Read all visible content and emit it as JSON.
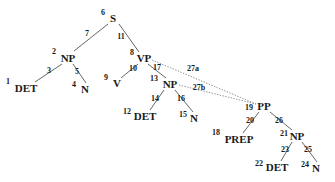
{
  "figure": {
    "name": "syntactic-parse-tree",
    "width": 335,
    "height": 182,
    "background": "#ffffff",
    "ink_color": "#1a1a1a",
    "solid_edge_color": "#555555",
    "dotted_edge_color": "#777777"
  },
  "nodes": [
    {
      "id": "n6",
      "label": "S",
      "index": "6",
      "x": 113,
      "y": 18,
      "index_x": 103,
      "index_y": 12
    },
    {
      "id": "n2",
      "label": "NP",
      "index": "2",
      "x": 68,
      "y": 58,
      "index_x": 54,
      "index_y": 51
    },
    {
      "id": "n8",
      "label": "VP",
      "index": "8",
      "x": 144,
      "y": 58,
      "index_x": 132,
      "index_y": 52
    },
    {
      "id": "n1",
      "label": "DET",
      "index": "1",
      "x": 26,
      "y": 88,
      "index_x": 8,
      "index_y": 81
    },
    {
      "id": "n4",
      "label": "N",
      "index": "4",
      "x": 85,
      "y": 89,
      "index_x": 74,
      "index_y": 84
    },
    {
      "id": "n9",
      "label": "V",
      "index": "9",
      "x": 117,
      "y": 83,
      "index_x": 106,
      "index_y": 77
    },
    {
      "id": "n13",
      "label": "NP",
      "index": "13",
      "x": 170,
      "y": 84,
      "index_x": 154,
      "index_y": 78
    },
    {
      "id": "n12",
      "label": "DET",
      "index": "12",
      "x": 145,
      "y": 116,
      "index_x": 127,
      "index_y": 111
    },
    {
      "id": "n15",
      "label": "N",
      "index": "15",
      "x": 194,
      "y": 118,
      "index_x": 183,
      "index_y": 114
    },
    {
      "id": "n19",
      "label": "PP",
      "index": "19",
      "x": 264,
      "y": 106,
      "index_x": 249,
      "index_y": 107
    },
    {
      "id": "n18",
      "label": "PREP",
      "index": "18",
      "x": 239,
      "y": 139,
      "index_x": 216,
      "index_y": 132
    },
    {
      "id": "n21",
      "label": "NP",
      "index": "21",
      "x": 297,
      "y": 136,
      "index_x": 284,
      "index_y": 133
    },
    {
      "id": "n22",
      "label": "DET",
      "index": "22",
      "x": 277,
      "y": 167,
      "index_x": 259,
      "index_y": 163
    },
    {
      "id": "n24",
      "label": "N",
      "index": "24",
      "x": 316,
      "y": 168,
      "index_x": 305,
      "index_y": 164
    }
  ],
  "edges": [
    {
      "id": "e7",
      "index": "7",
      "from": "n6",
      "to": "n2",
      "x1": 108,
      "y1": 24,
      "x2": 74,
      "y2": 51,
      "style": "solid",
      "index_x": 87,
      "index_y": 33
    },
    {
      "id": "e11",
      "index": "11",
      "from": "n6",
      "to": "n8",
      "x1": 119,
      "y1": 24,
      "x2": 139,
      "y2": 52,
      "style": "solid",
      "index_x": 121,
      "index_y": 36
    },
    {
      "id": "e3",
      "index": "3",
      "from": "n2",
      "to": "n1",
      "x1": 62,
      "y1": 64,
      "x2": 35,
      "y2": 82,
      "style": "solid",
      "index_x": 49,
      "index_y": 70
    },
    {
      "id": "e5",
      "index": "5",
      "from": "n2",
      "to": "n4",
      "x1": 73,
      "y1": 64,
      "x2": 86,
      "y2": 83,
      "style": "solid",
      "index_x": 77,
      "index_y": 71
    },
    {
      "id": "e10",
      "index": "10",
      "from": "n8",
      "to": "n9",
      "x1": 138,
      "y1": 64,
      "x2": 121,
      "y2": 78,
      "style": "solid",
      "index_x": 133,
      "index_y": 68
    },
    {
      "id": "e17",
      "index": "17",
      "from": "n8",
      "to": "n13",
      "x1": 148,
      "y1": 64,
      "x2": 166,
      "y2": 78,
      "style": "solid",
      "index_x": 157,
      "index_y": 67
    },
    {
      "id": "e14",
      "index": "14",
      "from": "n13",
      "to": "n12",
      "x1": 164,
      "y1": 90,
      "x2": 150,
      "y2": 110,
      "style": "solid",
      "index_x": 155,
      "index_y": 98
    },
    {
      "id": "e16",
      "index": "16",
      "from": "n13",
      "to": "n15",
      "x1": 175,
      "y1": 90,
      "x2": 193,
      "y2": 112,
      "style": "solid",
      "index_x": 181,
      "index_y": 98
    },
    {
      "id": "e27a",
      "index": "27a",
      "from": "n8",
      "to": "n19",
      "x1": 152,
      "y1": 60,
      "x2": 256,
      "y2": 104,
      "style": "dotted",
      "index_x": 193,
      "index_y": 68
    },
    {
      "id": "e27b",
      "index": "27b",
      "from": "n13",
      "to": "n19",
      "x1": 179,
      "y1": 85,
      "x2": 256,
      "y2": 104,
      "style": "dotted",
      "index_x": 199,
      "index_y": 87
    },
    {
      "id": "e20",
      "index": "20",
      "from": "n19",
      "to": "n18",
      "x1": 259,
      "y1": 112,
      "x2": 243,
      "y2": 133,
      "style": "solid",
      "index_x": 250,
      "index_y": 120
    },
    {
      "id": "e26",
      "index": "26",
      "from": "n19",
      "to": "n21",
      "x1": 270,
      "y1": 112,
      "x2": 292,
      "y2": 130,
      "style": "solid",
      "index_x": 279,
      "index_y": 120
    },
    {
      "id": "e23",
      "index": "23",
      "from": "n21",
      "to": "n22",
      "x1": 292,
      "y1": 142,
      "x2": 281,
      "y2": 161,
      "style": "solid",
      "index_x": 285,
      "index_y": 149
    },
    {
      "id": "e25",
      "index": "25",
      "from": "n21",
      "to": "n24",
      "x1": 302,
      "y1": 142,
      "x2": 317,
      "y2": 162,
      "style": "solid",
      "index_x": 308,
      "index_y": 149
    }
  ]
}
